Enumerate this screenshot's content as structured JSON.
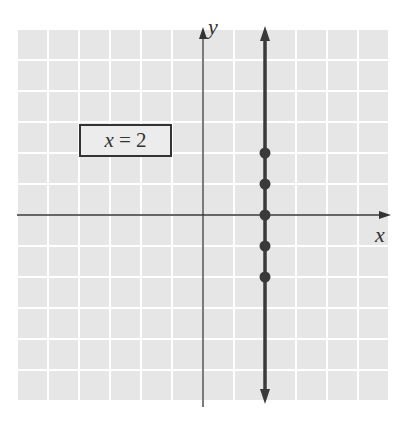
{
  "chart_data": {
    "type": "line",
    "title": "",
    "equation": "x = 2",
    "xlabel": "x",
    "ylabel": "y",
    "grid": true,
    "xlim": [
      -6,
      6
    ],
    "ylim": [
      -6,
      6
    ],
    "line": {
      "x": 2,
      "orientation": "vertical",
      "arrows": "both"
    },
    "points": [
      {
        "x": 2,
        "y": 2
      },
      {
        "x": 2,
        "y": 1
      },
      {
        "x": 2,
        "y": 0
      },
      {
        "x": 2,
        "y": -1
      },
      {
        "x": 2,
        "y": -2
      }
    ]
  },
  "labels": {
    "equation_var": "x",
    "equation_rest": " = 2",
    "x_axis": "x",
    "y_axis": "y"
  },
  "colors": {
    "grid_bg": "#e6e6e6",
    "grid_line": "#ffffff",
    "axis": "#333333",
    "line": "#3a3a3a"
  }
}
